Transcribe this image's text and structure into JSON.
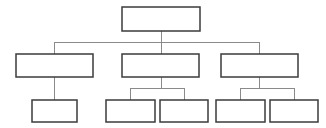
{
  "diagram": {
    "type": "hierarchy-tree",
    "levels": 3,
    "background_color": "#ffffff",
    "box_fill_color": "#ffffff",
    "box_border_color": "#3b3b3b",
    "connector_color": "#8a8a8a",
    "box_border_width": 1.5,
    "connector_width": 1
  },
  "nodes": [
    {
      "id": "root",
      "label": "",
      "level": 1,
      "x": 122,
      "y": 7,
      "width": 78,
      "height": 24
    },
    {
      "id": "branch-1",
      "label": "",
      "level": 2,
      "x": 16,
      "y": 54,
      "width": 77,
      "height": 23
    },
    {
      "id": "branch-2",
      "label": "",
      "level": 2,
      "x": 122,
      "y": 54,
      "width": 77,
      "height": 23
    },
    {
      "id": "branch-3",
      "label": "",
      "level": 2,
      "x": 221,
      "y": 54,
      "width": 77,
      "height": 23
    },
    {
      "id": "leaf-1",
      "label": "",
      "level": 3,
      "x": 32,
      "y": 100,
      "width": 45,
      "height": 22
    },
    {
      "id": "leaf-2",
      "label": "",
      "level": 3,
      "x": 106,
      "y": 100,
      "width": 49,
      "height": 22
    },
    {
      "id": "leaf-3",
      "label": "",
      "level": 3,
      "x": 160,
      "y": 100,
      "width": 48,
      "height": 22
    },
    {
      "id": "leaf-4",
      "label": "",
      "level": 3,
      "x": 216,
      "y": 100,
      "width": 49,
      "height": 22
    },
    {
      "id": "leaf-5",
      "label": "",
      "level": 3,
      "x": 270,
      "y": 100,
      "width": 48,
      "height": 22
    }
  ],
  "connectors": [
    {
      "id": "root-stem",
      "from": "root",
      "to": "level2-bus",
      "points": "161,31 161,42"
    },
    {
      "id": "level2-bus",
      "from": "root",
      "to": "branch-row",
      "points": "54,42 259,42"
    },
    {
      "id": "drop-branch-1",
      "from": "level2-bus",
      "to": "branch-1",
      "points": "54,42 54,54"
    },
    {
      "id": "drop-branch-2",
      "from": "level2-bus",
      "to": "branch-2",
      "points": "161,42 161,54"
    },
    {
      "id": "drop-branch-3",
      "from": "level2-bus",
      "to": "branch-3",
      "points": "259,42 259,54"
    },
    {
      "id": "branch-1-stem",
      "from": "branch-1",
      "to": "leaf-1",
      "points": "54,77 54,100"
    },
    {
      "id": "branch-2-stem",
      "from": "branch-2",
      "to": "bus-2",
      "points": "161,77 161,88"
    },
    {
      "id": "bus-2",
      "from": "branch-2",
      "to": "leaf-row-2",
      "points": "130,88 184,88"
    },
    {
      "id": "drop-leaf-2",
      "from": "bus-2",
      "to": "leaf-2",
      "points": "130,88 130,100"
    },
    {
      "id": "drop-leaf-3",
      "from": "bus-2",
      "to": "leaf-3",
      "points": "184,88 184,100"
    },
    {
      "id": "branch-3-stem",
      "from": "branch-3",
      "to": "bus-3",
      "points": "259,77 259,88"
    },
    {
      "id": "bus-3",
      "from": "branch-3",
      "to": "leaf-row-3",
      "points": "240,88 294,88"
    },
    {
      "id": "drop-leaf-4",
      "from": "bus-3",
      "to": "leaf-4",
      "points": "240,88 240,100"
    },
    {
      "id": "drop-leaf-5",
      "from": "bus-3",
      "to": "leaf-5",
      "points": "294,88 294,100"
    }
  ]
}
